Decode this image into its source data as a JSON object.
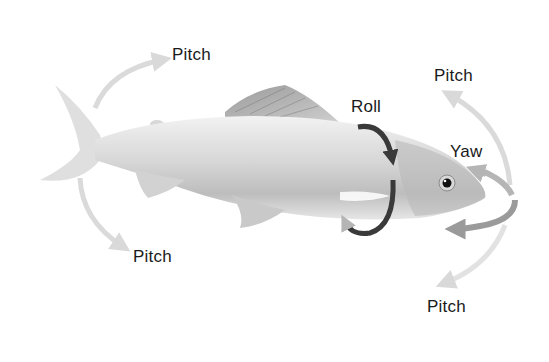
{
  "diagram": {
    "labels": {
      "pitch_top_left": "Pitch",
      "pitch_bottom_left": "Pitch",
      "pitch_top_right": "Pitch",
      "pitch_bottom_right": "Pitch",
      "roll": "Roll",
      "yaw": "Yaw"
    },
    "colors": {
      "pitch_arrow": "#d9d9d9",
      "roll_arrow": "#3a3a3a",
      "yaw_arrow": "#9a9a9a",
      "fish_body": "#c8c8c8",
      "text": "#1a1a1a"
    }
  }
}
